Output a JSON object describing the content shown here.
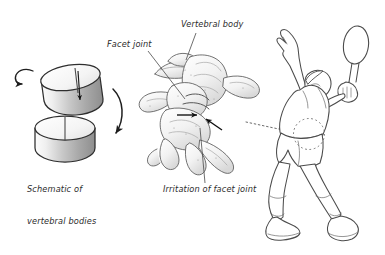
{
  "figure": {
    "background_color": "#ffffff",
    "ink_color": "#3a3a3a",
    "label_color": "#2b2b2b",
    "width": 385,
    "height": 255
  },
  "labels": {
    "facet_joint": "Facet joint",
    "vertebral_body": "Vertebral body",
    "irritation_of_facet_joint": "Irritation of facet joint",
    "schematic_line1": "Schematic of",
    "schematic_line2": "vertebral bodies"
  },
  "panels": {
    "schematic": {
      "name": "Schematic of vertebral bodies",
      "description": "Two tilted shaded cylinders representing vertebral bodies with rotation arrows",
      "cylinder_count": 2,
      "rotation_arrow_left": "counter-clockwise curved arrow",
      "rotation_arrow_right": "clockwise curved bracket arrow"
    },
    "vertebra": {
      "name": "Lumbar vertebra anatomical drawing",
      "description": "Three-quarter view line drawing of a lumbar vertebra with stippled shading",
      "indicator_arrows": 2
    },
    "athlete": {
      "name": "Tennis player serving",
      "description": "Line drawing of tennis player in serve position with racquet raised",
      "highlight": "dotted circle over lumbar region"
    }
  },
  "connectors": {
    "facet_joint_leader": "line from Facet joint label to facet joint on vertebra",
    "vertebral_body_leader": "line from Vertebral body label to vertebral body",
    "irritation_leader": "line from Irritation of facet joint label up to facet joint",
    "vertebra_to_athlete": "dotted line from vertebra to lumbar highlight circle"
  }
}
